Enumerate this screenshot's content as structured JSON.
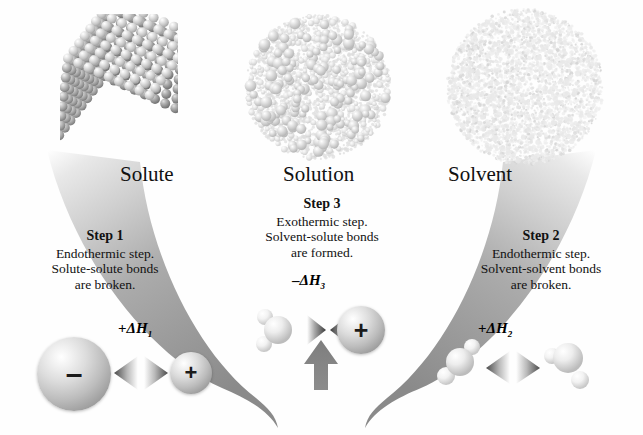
{
  "figure": {
    "type": "diagram",
    "background_color": "#fefefe"
  },
  "top_labels": [
    {
      "id": "solute",
      "text": "Solute"
    },
    {
      "id": "solution",
      "text": "Solution"
    },
    {
      "id": "solvent",
      "text": "Solvent"
    }
  ],
  "steps": {
    "step1": {
      "header": "Step 1",
      "line1": "Endothermic step.",
      "line2": "Solute-solute  bonds",
      "line3": "are broken.",
      "enthalpy_sign": "+",
      "enthalpy_symbol": "ΔH",
      "enthalpy_subscript": "1"
    },
    "step3": {
      "header": "Step 3",
      "line1": "Exothermic step.",
      "line2": "Solvent-solute bonds",
      "line3": "are formed.",
      "enthalpy_sign": "–",
      "enthalpy_symbol": "ΔH",
      "enthalpy_subscript": "3"
    },
    "step2": {
      "header": "Step 2",
      "line1": "Endothermic step.",
      "line2": "Solvent-solvent bonds",
      "line3": "are broken.",
      "enthalpy_sign": "+",
      "enthalpy_symbol": "ΔH",
      "enthalpy_subscript": "2"
    }
  },
  "particles": {
    "anion_sign": "–",
    "cation_sign": "+",
    "center_cation_sign": "+"
  },
  "colors": {
    "funnel_light": "#d9d9d9",
    "funnel_mid": "#b5b5b5",
    "funnel_dark": "#8c8c8c",
    "text": "#111111",
    "sphere_light": "#f2f2f2",
    "sphere_dark": "#8a8a8a"
  }
}
